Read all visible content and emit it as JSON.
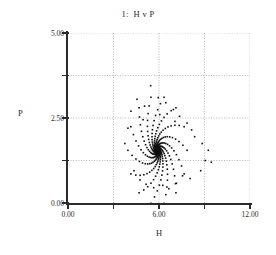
{
  "chart_data": {
    "type": "scatter",
    "title": "1:  H v P",
    "xlabel": "H",
    "ylabel": "P",
    "xlim": [
      0,
      12
    ],
    "ylim": [
      0,
      5
    ],
    "xticks": [
      0,
      6,
      12
    ],
    "xticklabels": [
      "0.00",
      "6.00",
      "12.00"
    ],
    "yticks": [
      0,
      2.5,
      5
    ],
    "yticklabels": [
      "0.00",
      "2.50",
      "5.00"
    ],
    "x_minor_ticks": [
      3,
      9
    ],
    "y_minor_ticks": [
      1.25,
      3.75
    ],
    "grid": true,
    "grid_style": "dotted",
    "grid_x": [
      3,
      6,
      9,
      12
    ],
    "grid_y": [
      1.25,
      2.5,
      3.75,
      5
    ],
    "marker": "square",
    "marker_size_px": 1.6,
    "marker_color": "#111111",
    "legend": null,
    "spiral": {
      "center_x": 5.9,
      "center_y": 1.55,
      "arms": 14,
      "points_per_arm": 26,
      "r_start": 1.95,
      "r_end": 0.05,
      "turn_radians": 2.7,
      "x_scale": 1.0,
      "y_scale": 0.82
    },
    "outliers_x": [
      4.15,
      4.55,
      5.05,
      5.45,
      5.95,
      6.45,
      6.95,
      7.35,
      7.85,
      8.35,
      8.85,
      9.25,
      9.45,
      3.95,
      3.75,
      4.35,
      5.15,
      6.25,
      7.15,
      8.05,
      8.75,
      9.05,
      4.75,
      5.65,
      6.65,
      7.55,
      4.95,
      6.05,
      7.05,
      8.15
    ],
    "outliers_y": [
      2.7,
      3.05,
      2.85,
      3.45,
      3.1,
      2.95,
      2.75,
      2.55,
      2.35,
      1.95,
      1.75,
      1.55,
      1.2,
      2.2,
      1.75,
      0.95,
      0.55,
      0.52,
      0.58,
      0.72,
      0.95,
      1.25,
      0.68,
      0.45,
      0.42,
      0.8,
      2.45,
      2.6,
      2.4,
      2.15
    ]
  }
}
